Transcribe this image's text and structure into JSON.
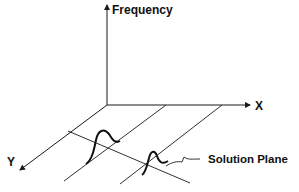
{
  "diagram": {
    "axes": {
      "vertical_label": "Frequency",
      "x_label": "X",
      "y_label": "Y"
    },
    "annotation": "Solution Plane",
    "colors": {
      "line": "#1a1a1a",
      "background": "#ffffff"
    }
  }
}
